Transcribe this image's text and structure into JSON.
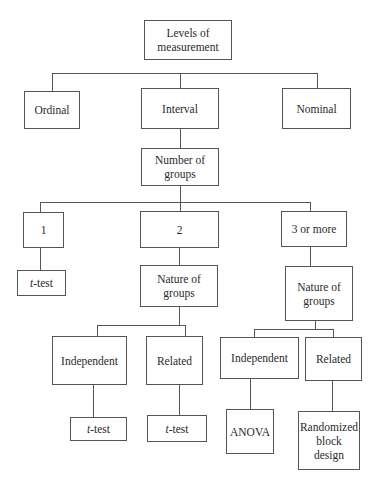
{
  "diagram": {
    "nodes": {
      "root": {
        "line1": "Levels of",
        "line2": "measurement"
      },
      "ordinal": {
        "label": "Ordinal"
      },
      "interval": {
        "label": "Interval"
      },
      "nominal": {
        "label": "Nominal"
      },
      "num_groups": {
        "line1": "Number of",
        "line2": "groups"
      },
      "g1": {
        "label": "1"
      },
      "g2": {
        "label": "2"
      },
      "g3": {
        "label": "3 or more"
      },
      "g1_test": {
        "italic": "t",
        "rest": "-test"
      },
      "nature2": {
        "line1": "Nature of",
        "line2": "groups"
      },
      "nature3": {
        "line1": "Nature of",
        "line2": "groups"
      },
      "ind2": {
        "label": "Independent"
      },
      "rel2": {
        "label": "Related"
      },
      "ind3": {
        "label": "Independent"
      },
      "rel3": {
        "label": "Related"
      },
      "ind2_test": {
        "italic": "t",
        "rest": "-test"
      },
      "rel2_test": {
        "italic": "t",
        "rest": "-test"
      },
      "anova": {
        "label": "ANOVA"
      },
      "rbd": {
        "line1": "Randomized",
        "line2": "block",
        "line3": "design"
      }
    },
    "edges": [
      [
        "root",
        "ordinal"
      ],
      [
        "root",
        "interval"
      ],
      [
        "root",
        "nominal"
      ],
      [
        "interval",
        "num_groups"
      ],
      [
        "num_groups",
        "g1"
      ],
      [
        "num_groups",
        "g2"
      ],
      [
        "num_groups",
        "g3"
      ],
      [
        "g1",
        "g1_test"
      ],
      [
        "g2",
        "nature2"
      ],
      [
        "g3",
        "nature3"
      ],
      [
        "nature2",
        "ind2"
      ],
      [
        "nature2",
        "rel2"
      ],
      [
        "nature3",
        "ind3"
      ],
      [
        "nature3",
        "rel3"
      ],
      [
        "ind2",
        "ind2_test"
      ],
      [
        "rel2",
        "rel2_test"
      ],
      [
        "ind3",
        "anova"
      ],
      [
        "rel3",
        "rbd"
      ]
    ],
    "line_color": "#555555"
  }
}
